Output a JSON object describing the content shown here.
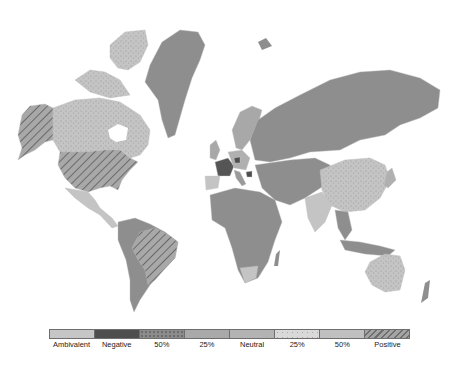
{
  "map": {
    "title": "World choropleth map",
    "colors": {
      "ambivalent": "#c8c8c8",
      "negative": "#555555",
      "neg50": "#8a8a8a",
      "neg25": "#a8a8a8",
      "neutral": "#9a9a9a",
      "pos25": "#d6d6d6",
      "pos50": "#bdbdbd",
      "positive": "#a0a0a0",
      "default": "#8e8e8e"
    },
    "regions": [
      {
        "name": "Alaska (USA)",
        "category": "Positive"
      },
      {
        "name": "Canada",
        "category": "25% positive"
      },
      {
        "name": "United States",
        "category": "Positive"
      },
      {
        "name": "Greenland",
        "category": "Neutral"
      },
      {
        "name": "Brazil",
        "category": "Positive"
      },
      {
        "name": "Russia",
        "category": "Neutral"
      },
      {
        "name": "China",
        "category": "25% positive"
      },
      {
        "name": "India",
        "category": "Ambivalent"
      },
      {
        "name": "Australia",
        "category": "25% positive"
      },
      {
        "name": "France",
        "category": "Negative"
      },
      {
        "name": "Africa",
        "category": "Neutral"
      },
      {
        "name": "South Africa",
        "category": "Ambivalent"
      }
    ]
  },
  "legend": {
    "items": [
      {
        "label": "Ambivalent",
        "color": "#c6c6c6",
        "pattern": "none"
      },
      {
        "label": "Negative",
        "color": "#4e4e4e",
        "pattern": "none"
      },
      {
        "label": "50%",
        "color": "#8c8c8c",
        "pattern": "dots"
      },
      {
        "label": "25%",
        "color": "#a9a9a9",
        "pattern": "none"
      },
      {
        "label": "Neutral",
        "color": "#b3b3b3",
        "pattern": "none"
      },
      {
        "label": "25%",
        "color": "#d9d9d9",
        "pattern": "speckle"
      },
      {
        "label": "50%",
        "color": "#c0c0c0",
        "pattern": "none"
      },
      {
        "label": "Positive",
        "color": "#a4a4a4",
        "pattern": "hatch"
      }
    ]
  }
}
